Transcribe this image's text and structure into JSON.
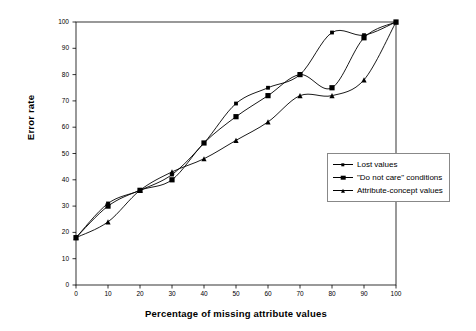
{
  "chart_data": {
    "type": "line",
    "title": "",
    "xlabel": "Percentage of missing attribute values",
    "ylabel": "Error rate",
    "xlim": [
      0,
      100
    ],
    "ylim": [
      0,
      100
    ],
    "xticks": [
      0,
      10,
      20,
      30,
      40,
      50,
      60,
      70,
      80,
      90,
      100
    ],
    "yticks": [
      0,
      10,
      20,
      30,
      40,
      50,
      60,
      70,
      80,
      90,
      100
    ],
    "grid": false,
    "legend_position": "right-lower",
    "x": [
      0,
      10,
      20,
      30,
      40,
      50,
      60,
      70,
      80,
      90,
      100
    ],
    "series": [
      {
        "name": "Lost values",
        "marker": "square-small",
        "values": [
          18,
          31,
          36,
          42,
          54,
          69,
          75,
          80,
          96,
          95,
          100
        ]
      },
      {
        "name": "\"Do not care\" conditions",
        "marker": "square",
        "values": [
          18,
          30,
          36,
          40,
          54,
          64,
          72,
          80,
          75,
          94,
          100
        ]
      },
      {
        "name": "Attribute-concept values",
        "marker": "triangle",
        "values": [
          18,
          24,
          36,
          43,
          48,
          55,
          62,
          72,
          72,
          78,
          100
        ]
      }
    ]
  },
  "legend": {
    "items": [
      {
        "label": "Lost values"
      },
      {
        "label": "\"Do not care\" conditions"
      },
      {
        "label": "Attribute-concept values"
      }
    ]
  },
  "colors": {
    "line": "#000000",
    "axis": "#000000",
    "background": "#ffffff",
    "legend_border": "#888888"
  }
}
